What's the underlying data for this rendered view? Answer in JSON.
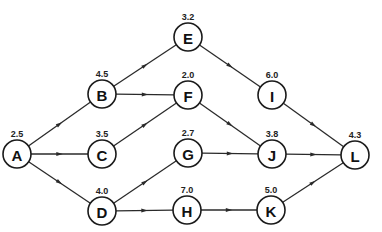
{
  "diagram": {
    "type": "activity-network",
    "nodes": [
      {
        "id": "A",
        "label": "A",
        "value": "2.5",
        "x": 17,
        "y": 154
      },
      {
        "id": "B",
        "label": "B",
        "value": "4.5",
        "x": 102,
        "y": 94
      },
      {
        "id": "C",
        "label": "C",
        "value": "3.5",
        "x": 102,
        "y": 154
      },
      {
        "id": "D",
        "label": "D",
        "value": "4.0",
        "x": 102,
        "y": 211
      },
      {
        "id": "E",
        "label": "E",
        "value": "3.2",
        "x": 188,
        "y": 37
      },
      {
        "id": "F",
        "label": "F",
        "value": "2.0",
        "x": 188,
        "y": 95
      },
      {
        "id": "G",
        "label": "G",
        "value": "2.7",
        "x": 188,
        "y": 153
      },
      {
        "id": "H",
        "label": "H",
        "value": "7.0",
        "x": 187,
        "y": 210
      },
      {
        "id": "I",
        "label": "I",
        "value": "6.0",
        "x": 272,
        "y": 95
      },
      {
        "id": "J",
        "label": "J",
        "value": "3.8",
        "x": 272,
        "y": 154
      },
      {
        "id": "K",
        "label": "K",
        "value": "5.0",
        "x": 271,
        "y": 210
      },
      {
        "id": "L",
        "label": "L",
        "value": "4.3",
        "x": 355,
        "y": 155
      }
    ],
    "edges": [
      {
        "from": "A",
        "to": "B"
      },
      {
        "from": "A",
        "to": "C"
      },
      {
        "from": "A",
        "to": "D"
      },
      {
        "from": "B",
        "to": "E"
      },
      {
        "from": "B",
        "to": "F"
      },
      {
        "from": "C",
        "to": "F"
      },
      {
        "from": "D",
        "to": "G"
      },
      {
        "from": "D",
        "to": "H"
      },
      {
        "from": "E",
        "to": "I"
      },
      {
        "from": "F",
        "to": "J"
      },
      {
        "from": "G",
        "to": "J"
      },
      {
        "from": "H",
        "to": "K"
      },
      {
        "from": "I",
        "to": "L"
      },
      {
        "from": "J",
        "to": "L"
      },
      {
        "from": "K",
        "to": "L"
      }
    ],
    "node_radius": 14
  }
}
